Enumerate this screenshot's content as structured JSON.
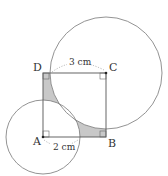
{
  "diagram": {
    "type": "geometry",
    "points": {
      "A": {
        "label": "A",
        "x": 43,
        "y": 137
      },
      "B": {
        "label": "B",
        "x": 106,
        "y": 137
      },
      "C": {
        "label": "C",
        "x": 106,
        "y": 73
      },
      "D": {
        "label": "D",
        "x": 43,
        "y": 73
      }
    },
    "circles": [
      {
        "center": "A",
        "radius_px": 37,
        "radius_label": "2 cm"
      },
      {
        "center": "C",
        "radius_px": 56,
        "radius_label": "3 cm"
      }
    ],
    "dimensions": {
      "top": "3 cm",
      "bottom": "2 cm"
    },
    "colors": {
      "line": "#666666",
      "shade": "#c8c8c8",
      "text": "#333333",
      "background": "#ffffff"
    }
  }
}
